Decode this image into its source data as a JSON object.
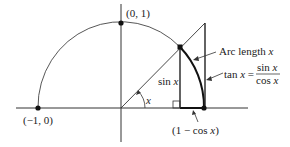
{
  "diagram": {
    "type": "unit-circle-trig-limit",
    "points": {
      "left": "(−1, 0)",
      "top": "(0, 1)"
    },
    "labels": {
      "angle": "x",
      "sin": "sin x",
      "one_minus_cos": "(1 − cos x)",
      "arc_text": "Arc length ",
      "arc_var": "x",
      "tan_lhs": "tan x =",
      "tan_num": "sin x",
      "tan_den": "cos x"
    },
    "colors": {
      "stroke": "#222222",
      "text": "#222222"
    }
  }
}
